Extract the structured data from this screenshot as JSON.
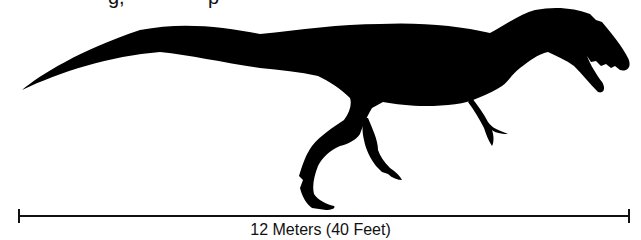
{
  "title_fragment": "g,     p",
  "figure": {
    "silhouette_color": "#000000",
    "background_color": "#ffffff"
  },
  "scale_bar": {
    "label": "12 Meters (40 Feet)",
    "length_m": 12,
    "length_ft": 40,
    "color": "#111111"
  }
}
